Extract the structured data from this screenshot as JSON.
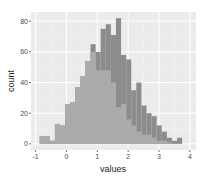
{
  "chart_data": {
    "type": "bar",
    "subtype": "overlapping-histogram",
    "title": "",
    "xlabel": "values",
    "ylabel": "count",
    "xlim": [
      -1.15,
      4.2
    ],
    "ylim": [
      -4,
      86
    ],
    "x_ticks": [
      -1,
      0,
      1,
      2,
      3,
      4
    ],
    "y_ticks": [
      0,
      20,
      40,
      60,
      80
    ],
    "grid": true,
    "legend": null,
    "bin_width": 0.165,
    "bin_start": -0.87,
    "series": [
      {
        "name": "series-dark",
        "color": "#8c8c8c",
        "values": [
          0,
          0,
          0,
          0,
          0,
          0,
          0,
          0,
          0,
          5,
          10,
          45,
          60,
          65,
          67,
          82,
          58,
          55,
          35,
          40,
          25,
          20,
          18,
          12,
          8,
          4,
          2,
          4
        ]
      },
      {
        "name": "series-light",
        "color": "#ababab",
        "values": [
          5,
          5,
          2,
          13,
          12,
          26,
          27,
          37,
          44,
          54,
          60,
          48,
          48,
          48,
          40,
          24,
          26,
          16,
          12,
          8,
          6,
          6,
          4,
          2,
          2,
          1,
          0,
          0
        ]
      }
    ],
    "top_envelope": [
      5,
      5,
      2,
      13,
      12,
      26,
      27,
      37,
      44,
      54,
      65,
      60,
      75,
      78,
      71,
      82,
      58,
      55,
      35,
      40,
      25,
      20,
      18,
      12,
      8,
      4,
      2,
      4
    ]
  },
  "axes": {
    "x_label": "values",
    "y_label": "count",
    "x_tick_labels": [
      "-1",
      "0",
      "1",
      "2",
      "3",
      "4"
    ],
    "y_tick_labels": [
      "0",
      "20",
      "40",
      "60",
      "80"
    ]
  },
  "colors": {
    "panel_bg": "#ebebeb",
    "grid_major": "#ffffff",
    "light_fill": "#ababab",
    "dark_fill": "#8c8c8c"
  }
}
